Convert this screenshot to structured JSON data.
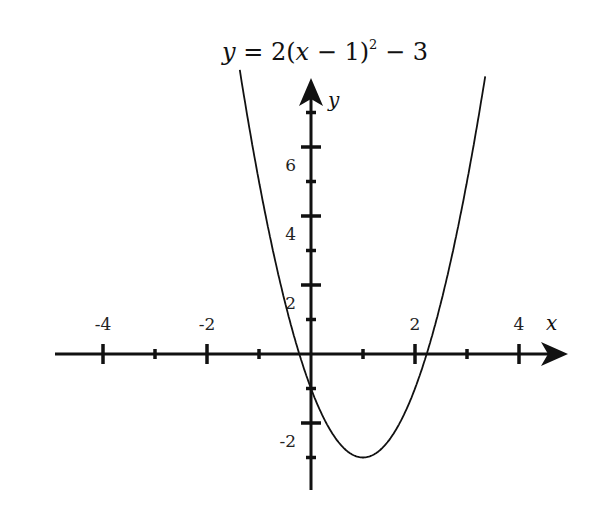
{
  "chart_data": {
    "type": "line",
    "title_parts": {
      "lhs": "y",
      "eq": " = 2(",
      "var": "x",
      "rest": " − 1)",
      "exp": "2",
      "tail": " − 3"
    },
    "xlabel": "x",
    "ylabel": "y",
    "function": "2*(x-1)^2 - 3",
    "xlim": [
      -5,
      5
    ],
    "ylim": [
      -4,
      8
    ],
    "x_ticks_major": [
      -4,
      -2,
      2,
      4
    ],
    "x_ticks_minor": [
      -3,
      -1,
      1,
      3
    ],
    "x_tick_labels": [
      "-4",
      "-2",
      "2",
      "4"
    ],
    "y_ticks_major": [
      2,
      4,
      6,
      -2
    ],
    "y_ticks_minor": [
      1,
      3,
      5,
      7,
      -1,
      -3
    ],
    "y_tick_labels": [
      "2",
      "4",
      "6",
      "-2"
    ],
    "vertex": [
      1,
      -3
    ],
    "y_intercept": [
      0,
      -1
    ],
    "x_intercepts": [
      -0.22,
      2.22
    ],
    "grid": false,
    "legend": null,
    "series": [
      {
        "name": "y = 2(x-1)^2 - 3",
        "x": [
          -1.37,
          -1,
          0,
          1,
          2,
          3,
          3.25
        ],
        "values": [
          8.2,
          5,
          -1,
          -3,
          -1,
          5,
          7.1
        ]
      }
    ]
  }
}
